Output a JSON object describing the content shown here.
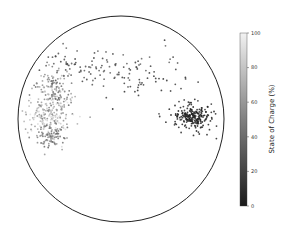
{
  "chart_data": {
    "type": "scatter",
    "title": "",
    "xlabel": "",
    "ylabel": "",
    "frame": "circle",
    "colorbar": {
      "label": "State of Charge (%)",
      "range": [
        0,
        100
      ],
      "ticks": [
        "0",
        "20",
        "40",
        "60",
        "80",
        "100"
      ],
      "colormap": "grayscale (dark=0, light=100)"
    },
    "clusters": [
      {
        "name": "upper-arc",
        "cx": 95,
        "cy": 68,
        "spread": [
          35,
          10
        ],
        "count": 110,
        "soc_range": [
          15,
          35
        ]
      },
      {
        "name": "right-arc",
        "cx": 155,
        "cy": 82,
        "spread": [
          20,
          12
        ],
        "count": 40,
        "soc_range": [
          5,
          20
        ]
      },
      {
        "name": "left-dense-upper",
        "cx": 52,
        "cy": 93,
        "spread": [
          10,
          12
        ],
        "count": 150,
        "soc_range": [
          35,
          75
        ]
      },
      {
        "name": "left-dense-lower",
        "cx": 48,
        "cy": 116,
        "spread": [
          12,
          10
        ],
        "count": 160,
        "soc_range": [
          50,
          95
        ]
      },
      {
        "name": "left-bottom",
        "cx": 52,
        "cy": 135,
        "spread": [
          8,
          7
        ],
        "count": 90,
        "soc_range": [
          30,
          60
        ]
      },
      {
        "name": "right-dense",
        "cx": 193,
        "cy": 117,
        "spread": [
          8,
          5
        ],
        "count": 170,
        "soc_range": [
          0,
          8
        ]
      },
      {
        "name": "right-halo",
        "cx": 193,
        "cy": 118,
        "spread": [
          14,
          10
        ],
        "count": 60,
        "soc_range": [
          0,
          12
        ]
      }
    ]
  }
}
